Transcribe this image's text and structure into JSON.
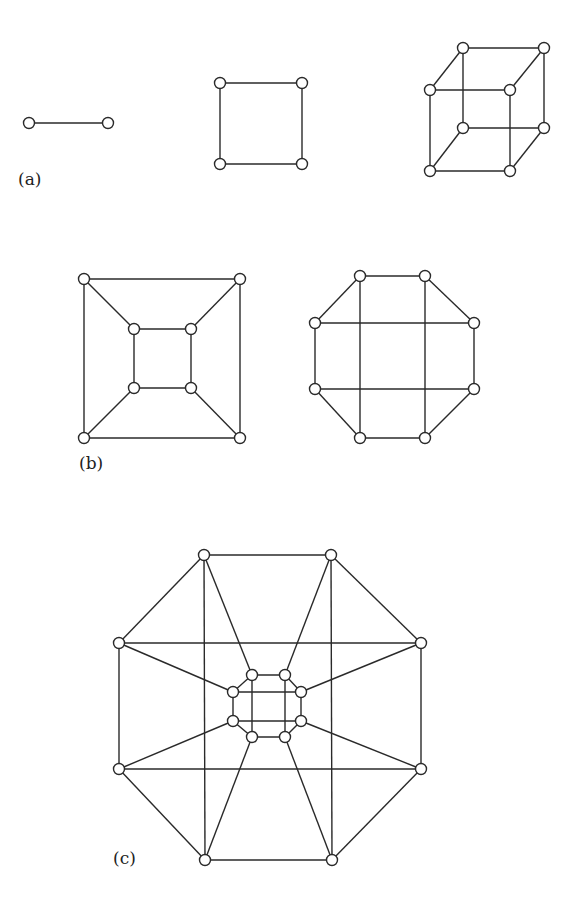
{
  "figure": {
    "panels": [
      {
        "id": "a",
        "label": "(a)",
        "label_pos": [
          18,
          185
        ],
        "node_radius": 5.5,
        "graphs": [
          {
            "name": "Q1",
            "nodes": [
              [
                29,
                123
              ],
              [
                108,
                123
              ]
            ],
            "edges": [
              [
                0,
                1
              ]
            ]
          },
          {
            "name": "Q2",
            "nodes": [
              [
                220,
                83
              ],
              [
                302,
                83
              ],
              [
                302,
                164
              ],
              [
                220,
                164
              ]
            ],
            "edges": [
              [
                0,
                1
              ],
              [
                1,
                2
              ],
              [
                2,
                3
              ],
              [
                3,
                0
              ]
            ]
          },
          {
            "name": "Q3",
            "nodes": [
              [
                463,
                48
              ],
              [
                544,
                48
              ],
              [
                544,
                128
              ],
              [
                463,
                128
              ],
              [
                430,
                90
              ],
              [
                510,
                90
              ],
              [
                510,
                171
              ],
              [
                430,
                171
              ]
            ],
            "edges": [
              [
                0,
                1
              ],
              [
                1,
                2
              ],
              [
                2,
                3
              ],
              [
                3,
                0
              ],
              [
                4,
                5
              ],
              [
                5,
                6
              ],
              [
                6,
                7
              ],
              [
                7,
                4
              ],
              [
                0,
                4
              ],
              [
                1,
                5
              ],
              [
                2,
                6
              ],
              [
                3,
                7
              ]
            ]
          }
        ]
      },
      {
        "id": "b",
        "label": "(b)",
        "label_pos": [
          79,
          469
        ],
        "node_radius": 5.5,
        "graphs": [
          {
            "name": "Q3-planar",
            "nodes": [
              [
                84,
                279
              ],
              [
                240,
                279
              ],
              [
                240,
                438
              ],
              [
                84,
                438
              ],
              [
                134,
                329
              ],
              [
                191,
                329
              ],
              [
                191,
                388
              ],
              [
                134,
                388
              ]
            ],
            "edges": [
              [
                0,
                1
              ],
              [
                1,
                2
              ],
              [
                2,
                3
              ],
              [
                3,
                0
              ],
              [
                4,
                5
              ],
              [
                5,
                6
              ],
              [
                6,
                7
              ],
              [
                7,
                4
              ],
              [
                0,
                4
              ],
              [
                1,
                5
              ],
              [
                2,
                6
              ],
              [
                3,
                7
              ]
            ]
          },
          {
            "name": "Q3-octagon",
            "nodes": [
              [
                360,
                276
              ],
              [
                425,
                276
              ],
              [
                474,
                323
              ],
              [
                474,
                389
              ],
              [
                425,
                438
              ],
              [
                360,
                438
              ],
              [
                315,
                389
              ],
              [
                315,
                323
              ]
            ],
            "edges": [
              [
                0,
                1
              ],
              [
                1,
                2
              ],
              [
                2,
                3
              ],
              [
                3,
                4
              ],
              [
                4,
                5
              ],
              [
                5,
                6
              ],
              [
                6,
                7
              ],
              [
                7,
                0
              ],
              [
                0,
                5
              ],
              [
                1,
                4
              ],
              [
                7,
                2
              ],
              [
                6,
                3
              ]
            ]
          }
        ]
      },
      {
        "id": "c",
        "label": "(c)",
        "label_pos": [
          113,
          864
        ],
        "node_radius": 5.5,
        "graphs": [
          {
            "name": "Q4",
            "nodes": [
              [
                204,
                555
              ],
              [
                331,
                555
              ],
              [
                421,
                643
              ],
              [
                421,
                769
              ],
              [
                332,
                860
              ],
              [
                205,
                860
              ],
              [
                119,
                769
              ],
              [
                119,
                643
              ],
              [
                252,
                675
              ],
              [
                285,
                675
              ],
              [
                301,
                692
              ],
              [
                301,
                721
              ],
              [
                285,
                737
              ],
              [
                252,
                737
              ],
              [
                233,
                721
              ],
              [
                233,
                692
              ]
            ],
            "edges": [
              [
                0,
                1
              ],
              [
                1,
                2
              ],
              [
                2,
                3
              ],
              [
                3,
                4
              ],
              [
                4,
                5
              ],
              [
                5,
                6
              ],
              [
                6,
                7
              ],
              [
                7,
                0
              ],
              [
                0,
                5
              ],
              [
                1,
                4
              ],
              [
                7,
                2
              ],
              [
                6,
                3
              ],
              [
                8,
                9
              ],
              [
                9,
                10
              ],
              [
                10,
                11
              ],
              [
                11,
                12
              ],
              [
                12,
                13
              ],
              [
                13,
                14
              ],
              [
                14,
                15
              ],
              [
                15,
                8
              ],
              [
                8,
                13
              ],
              [
                9,
                12
              ],
              [
                15,
                10
              ],
              [
                14,
                11
              ],
              [
                0,
                8
              ],
              [
                1,
                9
              ],
              [
                2,
                10
              ],
              [
                3,
                11
              ],
              [
                4,
                12
              ],
              [
                5,
                13
              ],
              [
                6,
                14
              ],
              [
                7,
                15
              ]
            ]
          }
        ]
      }
    ]
  }
}
